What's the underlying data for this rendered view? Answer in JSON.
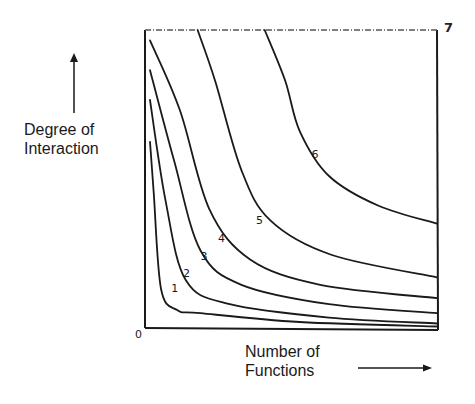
{
  "chart_data": {
    "type": "line",
    "title": "",
    "xlabel": "Number of Functions",
    "ylabel": "Degree of Interaction",
    "xlabel_lines": [
      "Number of",
      "Functions"
    ],
    "ylabel_lines": [
      "Degree of",
      "Interaction"
    ],
    "origin_label": "0",
    "corner_label": "7",
    "xlim": [
      0,
      1
    ],
    "ylim": [
      0,
      1
    ],
    "grid": false,
    "legend": "none (curves labeled inline)",
    "units": "conceptual / normalized (no numeric ticks shown)",
    "series": [
      {
        "name": "1",
        "label_at": [
          0.09,
          0.12
        ],
        "x": [
          0.017,
          0.03,
          0.055,
          0.11,
          0.19,
          0.53,
          1.0
        ],
        "y": [
          0.625,
          0.45,
          0.13,
          0.06,
          0.05,
          0.02,
          0.005
        ]
      },
      {
        "name": "2",
        "label_at": [
          0.13,
          0.17
        ],
        "x": [
          0.017,
          0.07,
          0.14,
          0.29,
          0.63,
          1.0
        ],
        "y": [
          0.765,
          0.43,
          0.16,
          0.08,
          0.035,
          0.015
        ]
      },
      {
        "name": "3",
        "label_at": [
          0.19,
          0.23
        ],
        "x": [
          0.017,
          0.1,
          0.19,
          0.33,
          0.63,
          1.0
        ],
        "y": [
          0.865,
          0.56,
          0.26,
          0.145,
          0.08,
          0.05
        ]
      },
      {
        "name": "4",
        "label_at": [
          0.25,
          0.29
        ],
        "x": [
          0.017,
          0.12,
          0.22,
          0.36,
          0.6,
          1.0
        ],
        "y": [
          0.965,
          0.73,
          0.4,
          0.23,
          0.145,
          0.1
        ]
      },
      {
        "name": "5",
        "label_at": [
          0.38,
          0.35
        ],
        "x": [
          0.18,
          0.24,
          0.33,
          0.43,
          0.64,
          1.0
        ],
        "y": [
          1.0,
          0.83,
          0.53,
          0.36,
          0.245,
          0.17
        ]
      },
      {
        "name": "6",
        "label_at": [
          0.57,
          0.57
        ],
        "x": [
          0.41,
          0.48,
          0.53,
          0.63,
          0.8,
          1.0
        ],
        "y": [
          1.0,
          0.83,
          0.66,
          0.51,
          0.41,
          0.35
        ]
      }
    ]
  }
}
